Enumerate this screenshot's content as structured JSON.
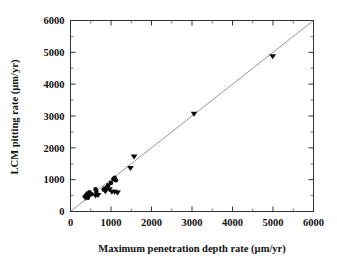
{
  "chart_data": {
    "type": "scatter",
    "title": "",
    "xlabel": "Maximum penetration depth rate (µm/yr)",
    "ylabel": "LCM pitting rate (µm/yr)",
    "xlim": [
      0,
      6000
    ],
    "ylim": [
      0,
      6000
    ],
    "xticks": [
      0,
      1000,
      2000,
      3000,
      4000,
      5000,
      6000
    ],
    "yticks": [
      0,
      1000,
      2000,
      3000,
      4000,
      5000,
      6000
    ],
    "xtick_labels": [
      "0",
      "1000",
      "2000",
      "3000",
      "4000",
      "5000",
      "6000"
    ],
    "ytick_labels": [
      "0",
      "1000",
      "2000",
      "3000",
      "4000",
      "5000",
      "6000"
    ],
    "minor_tick_step": 500,
    "grid": false,
    "legend": "none",
    "marker_color": "#0b0b0b",
    "reference_line": {
      "label": "1:1 line",
      "color": "#8a8a8a",
      "x": [
        0,
        6000
      ],
      "y": [
        0,
        6000
      ]
    },
    "series": [
      {
        "name": "circle-markers",
        "marker": "circle",
        "points": [
          {
            "x": 360,
            "y": 470
          },
          {
            "x": 390,
            "y": 520
          },
          {
            "x": 420,
            "y": 560
          },
          {
            "x": 430,
            "y": 430
          },
          {
            "x": 470,
            "y": 600
          },
          {
            "x": 520,
            "y": 540
          },
          {
            "x": 620,
            "y": 700
          },
          {
            "x": 640,
            "y": 620
          },
          {
            "x": 820,
            "y": 690
          },
          {
            "x": 900,
            "y": 760
          },
          {
            "x": 930,
            "y": 820
          },
          {
            "x": 1000,
            "y": 900
          },
          {
            "x": 1060,
            "y": 1020
          },
          {
            "x": 1090,
            "y": 1060
          },
          {
            "x": 1120,
            "y": 980
          }
        ]
      },
      {
        "name": "triangle-markers",
        "marker": "triangle-down",
        "points": [
          {
            "x": 370,
            "y": 430
          },
          {
            "x": 450,
            "y": 470
          },
          {
            "x": 620,
            "y": 500
          },
          {
            "x": 680,
            "y": 520
          },
          {
            "x": 860,
            "y": 640
          },
          {
            "x": 880,
            "y": 720
          },
          {
            "x": 960,
            "y": 700
          },
          {
            "x": 1020,
            "y": 620
          },
          {
            "x": 1090,
            "y": 620
          },
          {
            "x": 1160,
            "y": 600
          },
          {
            "x": 1480,
            "y": 1370
          },
          {
            "x": 1570,
            "y": 1730
          },
          {
            "x": 3050,
            "y": 3070
          },
          {
            "x": 4990,
            "y": 4880
          }
        ]
      }
    ]
  }
}
